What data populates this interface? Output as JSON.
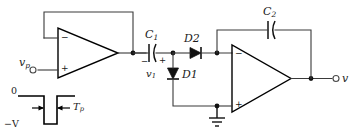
{
  "diagram": {
    "background_color": "#ffffff",
    "line_color": "#3a3a3a",
    "device_color": "#111111"
  },
  "input": {
    "terminal_label": "v",
    "terminal_sub": "p",
    "node_name": "input-terminal"
  },
  "output": {
    "terminal_label": "v",
    "node_name": "output-terminal"
  },
  "waveform": {
    "top_label": "0",
    "bottom_label": "−V",
    "width_label": "T",
    "width_sub": "p",
    "description": "negative-going rectangular pulse of amplitude minus V and duration T sub p"
  },
  "components": {
    "cap1": {
      "label": "C",
      "sub": "1",
      "left_polarity": "−",
      "right_polarity": "+",
      "node_voltage_label": "v",
      "node_voltage_sub": "1"
    },
    "cap2": {
      "label": "C",
      "sub": "2"
    },
    "diode1": {
      "label": "D1",
      "orientation": "cathode-down"
    },
    "diode2": {
      "label": "D2",
      "orientation": "cathode-right"
    },
    "opamp1": {
      "name": "voltage-follower",
      "inverting_pin": "−",
      "noninverting_pin": "+"
    },
    "opamp2": {
      "name": "integrator",
      "inverting_pin": "−",
      "noninverting_pin": "+"
    },
    "ground": {
      "label": "ground-symbol"
    }
  }
}
